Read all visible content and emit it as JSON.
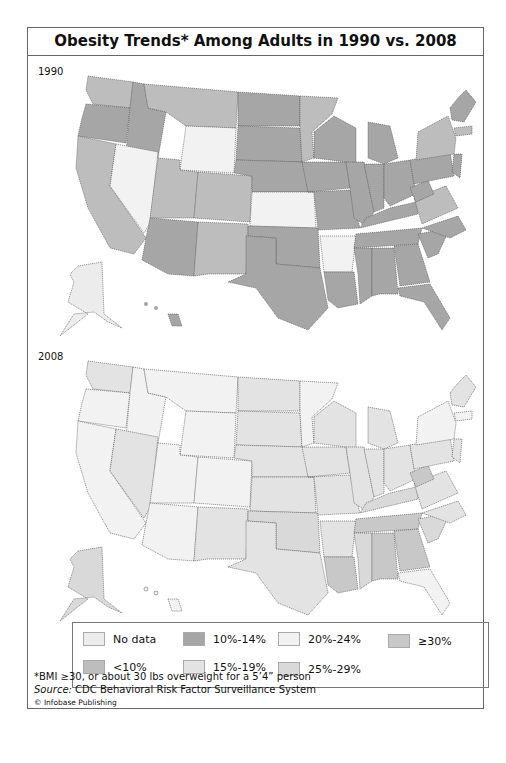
{
  "title": "Obesity Trends* Among Adults in 1990 vs. 2008",
  "maps": [
    {
      "year_label": "1990"
    },
    {
      "year_label": "2008"
    }
  ],
  "legend": [
    {
      "label": "No data",
      "color": "#ececec"
    },
    {
      "label": "10%-14%",
      "color": "#a6a6a6"
    },
    {
      "label": "20%-24%",
      "color": "#f2f2f2"
    },
    {
      "label": "≥30%",
      "color": "#c8c8c8"
    },
    {
      "label": "<10%",
      "color": "#bdbdbd"
    },
    {
      "label": "15%-19%",
      "color": "#e3e3e3"
    },
    {
      "label": "25%-29%",
      "color": "#d9d9d9"
    }
  ],
  "footnote": "*BMI ≥30, or about 30 lbs overweight for a 5’4” person",
  "source_label": "Source:",
  "source_text": " CDC Behavioral Risk Factor Surveillance System",
  "copyright": "© Infobase Publishing"
}
